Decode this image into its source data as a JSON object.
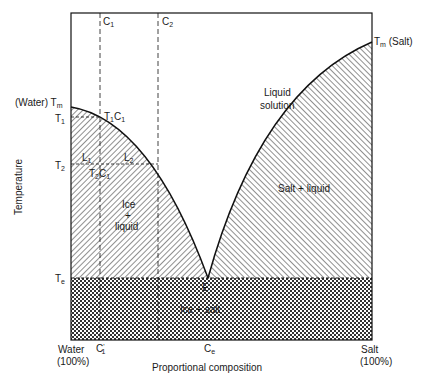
{
  "diagram": {
    "type": "phase-diagram",
    "axes": {
      "y_label": "Temperature",
      "x_label": "Proportional composition",
      "x_left": {
        "line1": "Water",
        "line2": "(100%)"
      },
      "x_right": {
        "line1": "Salt",
        "line2": "(100%)"
      }
    },
    "y_ticks": {
      "tm_water": "(Water) T",
      "tm_water_sub": "m",
      "t1": "T",
      "t1_sub": "1",
      "t2": "T",
      "t2_sub": "2",
      "te": "T",
      "te_sub": "e"
    },
    "x_ticks": {
      "c1_prime": "C",
      "c1_prime_sub": "1",
      "c1_prime_sup": "'",
      "ce": "C",
      "ce_sub": "e"
    },
    "top_markers": {
      "c1": "C",
      "c1_sub": "1",
      "c2": "C",
      "c2_sub": "2"
    },
    "tm_salt": {
      "t": "T",
      "sub": "m",
      "rest": " (Salt)"
    },
    "regions": {
      "liquid_line1": "Liquid",
      "liquid_line2": "solution",
      "ice_line1": "Ice",
      "ice_line2": "+",
      "ice_line3": "liquid",
      "salt_liquid": "Salt + liquid",
      "ice_salt": "Ice + salt"
    },
    "points": {
      "t1c1": {
        "t": "T",
        "tsub": "1",
        "c": "C",
        "csub": "1"
      },
      "t2c1": {
        "t": "T",
        "tsub": "2",
        "c": "C",
        "csub": "1"
      },
      "l1": {
        "l": "L",
        "sub": "1"
      },
      "l2": {
        "l": "L",
        "sub": "2"
      },
      "eutectic": "E"
    }
  }
}
